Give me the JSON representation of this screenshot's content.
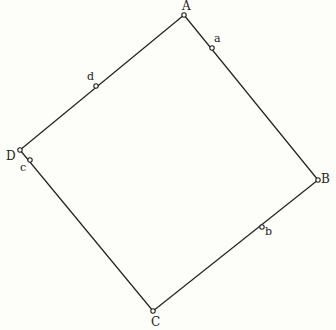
{
  "diagram": {
    "type": "square",
    "vertices": [
      {
        "label": "A",
        "x": 184,
        "y": 15,
        "lx": 182,
        "ly": 10
      },
      {
        "label": "B",
        "x": 318,
        "y": 180,
        "lx": 321,
        "ly": 183
      },
      {
        "label": "C",
        "x": 153,
        "y": 311,
        "lx": 151,
        "ly": 326
      },
      {
        "label": "D",
        "x": 20,
        "y": 150,
        "lx": 6,
        "ly": 160
      }
    ],
    "midpoints": [
      {
        "label": "a",
        "x": 212,
        "y": 48,
        "lx": 214,
        "ly": 42
      },
      {
        "label": "b",
        "x": 262,
        "y": 227,
        "lx": 265,
        "ly": 235
      },
      {
        "label": "c",
        "x": 30,
        "y": 160,
        "lx": 20,
        "ly": 171
      },
      {
        "label": "d",
        "x": 96,
        "y": 86,
        "lx": 87,
        "ly": 80
      }
    ]
  }
}
